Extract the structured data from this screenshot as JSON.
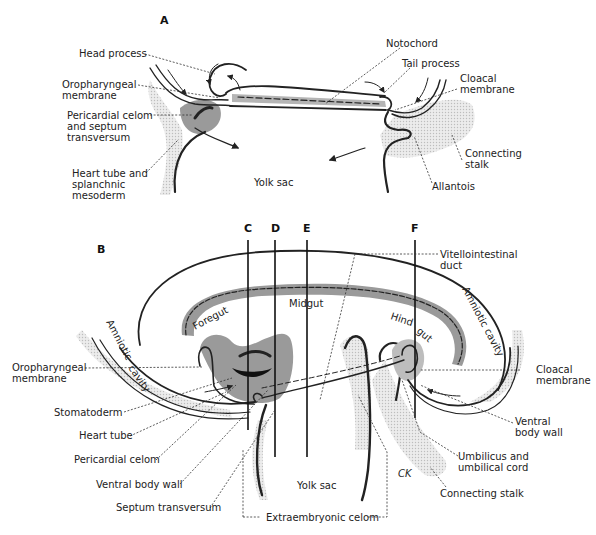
{
  "panel_a": {
    "letter": "A",
    "labels": {
      "head_process": "Head process",
      "oropharyngeal_1": "Oropharyngeal",
      "oropharyngeal_2": "membrane",
      "pericardial_1": "Pericardial celom",
      "pericardial_2": "and septum",
      "pericardial_3": "transversum",
      "heart_1": "Heart tube and",
      "heart_2": "splanchnic",
      "heart_3": "mesoderm",
      "yolk_sac": "Yolk sac",
      "notochord": "Notochord",
      "tail_process": "Tail process",
      "cloacal_1": "Cloacal",
      "cloacal_2": "membrane",
      "connecting_1": "Connecting",
      "connecting_2": "stalk",
      "allantois": "Allantois"
    }
  },
  "panel_b": {
    "letter": "B",
    "section_lines": [
      "C",
      "D",
      "E",
      "F"
    ],
    "labels": {
      "vitello_1": "Vitellointestinal",
      "vitello_2": "duct",
      "foregut": "Foregut",
      "midgut": "Midgut",
      "hindgut_1": "Hind",
      "hindgut_2": "gut",
      "amniotic_left_1": "Amniotic",
      "amniotic_left_2": "cavity",
      "amniotic_right": "Amniotic cavity",
      "oropharyngeal_1": "Oropharyngeal",
      "oropharyngeal_2": "membrane",
      "stomatoderm": "Stomatoderm",
      "heart_tube": "Heart tube",
      "pericardial_celom": "Pericardial celom",
      "ventral_body_wall_left": "Ventral body wall",
      "septum_transversum": "Septum transversum",
      "cloacal_1": "Cloacal",
      "cloacal_2": "membrane",
      "ventral_1": "Ventral",
      "ventral_2": "body wall",
      "umbilicus_1": "Umbilicus and",
      "umbilicus_2": "umbilical cord",
      "connecting_stalk": "Connecting stalk",
      "yolk_sac": "Yolk sac",
      "extraembryonic": "Extraembryonic celom",
      "signature": "CK"
    }
  }
}
